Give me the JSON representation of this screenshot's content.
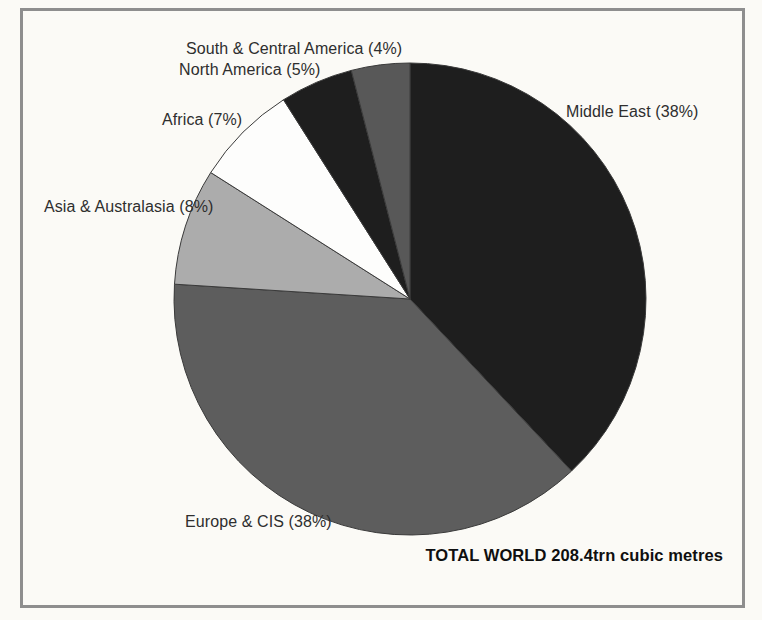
{
  "figure": {
    "background": "#fbfaf6",
    "frame_color": "#8e8e8e",
    "slice_outline_color": "#3a3a3a"
  },
  "chart_data": {
    "type": "pie",
    "title": "",
    "start_angle_deg": 0,
    "direction": "clockwise",
    "legend_position": "labels-around-pie",
    "slices": [
      {
        "label": "Middle East",
        "pct": 38,
        "display": "Middle East (38%)",
        "color": "#1e1e1e"
      },
      {
        "label": "Europe & CIS",
        "pct": 38,
        "display": "Europe & CIS (38%)",
        "color": "#5d5d5d"
      },
      {
        "label": "Asia & Australasia",
        "pct": 8,
        "display": "Asia & Australasia (8%)",
        "color": "#acacac"
      },
      {
        "label": "Africa",
        "pct": 7,
        "display": "Africa (7%)",
        "color": "#fdfdfc"
      },
      {
        "label": "North America",
        "pct": 5,
        "display": "North America (5%)",
        "color": "#1e1e1e"
      },
      {
        "label": "South & Central America",
        "pct": 4,
        "display": "South & Central America (4%)",
        "color": "#585858"
      }
    ],
    "total_label": "TOTAL WORLD 208.4trn cubic metres"
  }
}
